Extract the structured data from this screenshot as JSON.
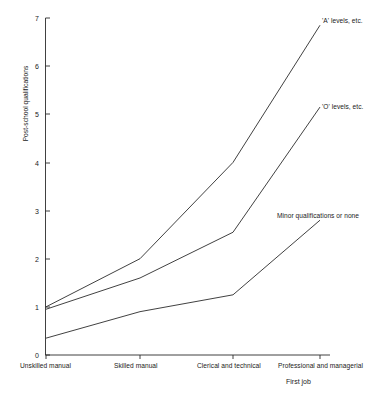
{
  "chart_data": {
    "type": "line",
    "title": "",
    "xlabel": "First job",
    "ylabel": "Post-school qualifications",
    "categories": [
      "Unskilled manual",
      "Skilled manual",
      "Clerical and technical",
      "Professional and managerial"
    ],
    "ylim": [
      0,
      7
    ],
    "yticks": [
      "0",
      "1",
      "2",
      "3",
      "4",
      "5",
      "6",
      "7"
    ],
    "grid": false,
    "legend_position": "inline-right-of-line-end",
    "series": [
      {
        "name": "'A' levels, etc.",
        "values": [
          1.0,
          2.0,
          4.0,
          6.85
        ],
        "color": "#2b2b2b"
      },
      {
        "name": "'O' levels, etc.",
        "values": [
          0.95,
          1.6,
          2.55,
          5.15
        ],
        "color": "#2b2b2b"
      },
      {
        "name": "Minor qualifications or none",
        "values": [
          0.35,
          0.9,
          1.25,
          2.8
        ],
        "color": "#2b2b2b"
      }
    ]
  },
  "axes": {
    "y_tick_0": "0",
    "y_tick_1": "1",
    "y_tick_2": "2",
    "y_tick_3": "3",
    "y_tick_4": "4",
    "y_tick_5": "5",
    "y_tick_6": "6",
    "y_tick_7": "7",
    "y_axis_title": "Post-school qualifications",
    "x_axis_title": "First job"
  },
  "categories": {
    "cat_0": "Unskilled manual",
    "cat_1": "Skilled manual",
    "cat_2": "Clerical and technical",
    "cat_3": "Professional and managerial"
  },
  "series_labels": {
    "a_levels": "'A' levels, etc.",
    "o_levels": "'O' levels, etc.",
    "minor": "Minor qualifications or none"
  }
}
